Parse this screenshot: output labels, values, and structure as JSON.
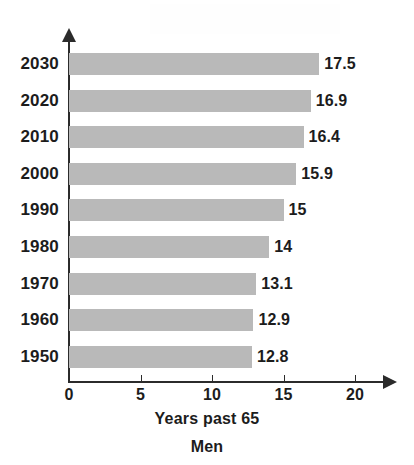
{
  "chart_data": {
    "type": "bar",
    "orientation": "horizontal",
    "title": "",
    "xlabel": "Years past 65",
    "sublabel": "Men",
    "ylabel": "",
    "categories": [
      "2030",
      "2020",
      "2010",
      "2000",
      "1990",
      "1980",
      "1970",
      "1960",
      "1950"
    ],
    "values": [
      17.5,
      16.9,
      16.4,
      15.9,
      15,
      14,
      13.1,
      12.9,
      12.8
    ],
    "value_labels": [
      "17.5",
      "16.9",
      "16.4",
      "15.9",
      "15",
      "14",
      "13.1",
      "12.9",
      "12.8"
    ],
    "xlim": [
      0,
      20
    ],
    "xticks": [
      0,
      5,
      10,
      15,
      20
    ],
    "xtick_labels": [
      "0",
      "5",
      "10",
      "15",
      "20"
    ],
    "grid": false,
    "legend": null,
    "bar_color": "#b9b9b9",
    "axis_color": "#2b2b2b",
    "text_color": "#1c1c1c"
  },
  "axis": {
    "x_title": "Years past 65",
    "x_subtitle": "Men"
  }
}
